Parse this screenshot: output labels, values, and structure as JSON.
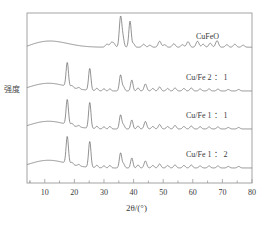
{
  "chart_data": {
    "type": "line",
    "title": "",
    "xlabel": "2θ/(°)",
    "ylabel": "强度",
    "xlim": [
      4,
      80
    ],
    "ylim": [
      0,
      1
    ],
    "grid": false,
    "legend_position": "inline-right",
    "xticks": [
      10,
      20,
      30,
      40,
      50,
      60,
      70,
      80
    ],
    "xtick_labels": [
      "10",
      "20",
      "30",
      "40",
      "50",
      "60",
      "70",
      "80"
    ],
    "yticks": [],
    "ytick_labels": [],
    "line_color": "#6e6e6e",
    "axis_color": "#9a9a9a",
    "series": [
      {
        "name": "CuFeO",
        "label": "CuFeO",
        "baseline": 50,
        "label_x": 196,
        "label_y": 32,
        "hump": {
          "center": 11,
          "width": 9,
          "height": 7
        },
        "slope": 8,
        "peaks": [
          {
            "two_theta": 31.0,
            "height": 3.0,
            "width": 0.5
          },
          {
            "two_theta": 32.5,
            "height": 4.5,
            "width": 0.5
          },
          {
            "two_theta": 33.4,
            "height": 3.2,
            "width": 0.45
          },
          {
            "two_theta": 35.6,
            "height": 30.0,
            "width": 0.42
          },
          {
            "two_theta": 36.4,
            "height": 9.0,
            "width": 0.4
          },
          {
            "two_theta": 38.8,
            "height": 26.0,
            "width": 0.4
          },
          {
            "two_theta": 40.0,
            "height": 3.5,
            "width": 0.4
          },
          {
            "two_theta": 43.4,
            "height": 3.0,
            "width": 0.5
          },
          {
            "two_theta": 45.5,
            "height": 2.0,
            "width": 0.5
          },
          {
            "two_theta": 48.8,
            "height": 6.0,
            "width": 0.5
          },
          {
            "two_theta": 50.5,
            "height": 2.5,
            "width": 0.5
          },
          {
            "two_theta": 53.6,
            "height": 3.5,
            "width": 0.5
          },
          {
            "two_theta": 56.5,
            "height": 2.5,
            "width": 0.5
          },
          {
            "two_theta": 58.4,
            "height": 5.5,
            "width": 0.5
          },
          {
            "two_theta": 61.6,
            "height": 6.0,
            "width": 0.5
          },
          {
            "two_theta": 63.5,
            "height": 3.0,
            "width": 0.5
          },
          {
            "two_theta": 65.9,
            "height": 4.0,
            "width": 0.5
          },
          {
            "two_theta": 68.2,
            "height": 6.5,
            "width": 0.5
          },
          {
            "two_theta": 71.5,
            "height": 2.5,
            "width": 0.5
          },
          {
            "two_theta": 74.2,
            "height": 3.0,
            "width": 0.5
          },
          {
            "two_theta": 77.0,
            "height": 2.0,
            "width": 0.5
          }
        ]
      },
      {
        "name": "Cu/Fe 2:1",
        "label": "Cu/Fe 2 ： 1",
        "baseline": 92,
        "label_x": 186,
        "label_y": 71,
        "hump": {
          "center": 11,
          "width": 9,
          "height": 8
        },
        "slope": 3,
        "peaks": [
          {
            "two_theta": 17.6,
            "height": 24.0,
            "width": 0.4
          },
          {
            "two_theta": 19.2,
            "height": 2.0,
            "width": 0.4
          },
          {
            "two_theta": 21.5,
            "height": 1.5,
            "width": 0.4
          },
          {
            "two_theta": 25.2,
            "height": 22.0,
            "width": 0.4
          },
          {
            "two_theta": 27.6,
            "height": 2.5,
            "width": 0.4
          },
          {
            "two_theta": 30.0,
            "height": 2.0,
            "width": 0.4
          },
          {
            "two_theta": 32.0,
            "height": 2.0,
            "width": 0.4
          },
          {
            "two_theta": 35.6,
            "height": 16.0,
            "width": 0.4
          },
          {
            "two_theta": 36.6,
            "height": 4.0,
            "width": 0.4
          },
          {
            "two_theta": 39.4,
            "height": 11.0,
            "width": 0.4
          },
          {
            "two_theta": 41.5,
            "height": 3.0,
            "width": 0.4
          },
          {
            "two_theta": 44.0,
            "height": 7.0,
            "width": 0.45
          },
          {
            "two_theta": 46.5,
            "height": 2.5,
            "width": 0.45
          },
          {
            "two_theta": 48.8,
            "height": 4.0,
            "width": 0.45
          },
          {
            "two_theta": 51.5,
            "height": 2.5,
            "width": 0.45
          },
          {
            "two_theta": 54.0,
            "height": 3.0,
            "width": 0.45
          },
          {
            "two_theta": 57.0,
            "height": 2.5,
            "width": 0.45
          },
          {
            "two_theta": 59.5,
            "height": 3.0,
            "width": 0.45
          },
          {
            "two_theta": 62.5,
            "height": 2.0,
            "width": 0.45
          },
          {
            "two_theta": 65.5,
            "height": 2.0,
            "width": 0.45
          },
          {
            "two_theta": 68.5,
            "height": 1.8,
            "width": 0.45
          },
          {
            "two_theta": 72.0,
            "height": 1.5,
            "width": 0.45
          },
          {
            "two_theta": 75.5,
            "height": 1.5,
            "width": 0.45
          }
        ]
      },
      {
        "name": "Cu/Fe 1:1",
        "label": "Cu/Fe 1 ： 1",
        "baseline": 130,
        "label_x": 186,
        "label_y": 109,
        "hump": {
          "center": 11,
          "width": 9,
          "height": 8
        },
        "slope": 3,
        "peaks": [
          {
            "two_theta": 17.6,
            "height": 25.0,
            "width": 0.4
          },
          {
            "two_theta": 19.2,
            "height": 2.2,
            "width": 0.4
          },
          {
            "two_theta": 21.5,
            "height": 1.5,
            "width": 0.4
          },
          {
            "two_theta": 25.2,
            "height": 26.0,
            "width": 0.4
          },
          {
            "two_theta": 27.6,
            "height": 2.5,
            "width": 0.4
          },
          {
            "two_theta": 30.0,
            "height": 2.0,
            "width": 0.4
          },
          {
            "two_theta": 32.0,
            "height": 2.5,
            "width": 0.4
          },
          {
            "two_theta": 35.6,
            "height": 14.0,
            "width": 0.4
          },
          {
            "two_theta": 36.6,
            "height": 4.0,
            "width": 0.4
          },
          {
            "two_theta": 39.4,
            "height": 9.0,
            "width": 0.4
          },
          {
            "two_theta": 41.5,
            "height": 3.0,
            "width": 0.4
          },
          {
            "two_theta": 44.0,
            "height": 7.5,
            "width": 0.45
          },
          {
            "two_theta": 46.5,
            "height": 2.5,
            "width": 0.45
          },
          {
            "two_theta": 48.8,
            "height": 4.5,
            "width": 0.45
          },
          {
            "two_theta": 51.5,
            "height": 2.5,
            "width": 0.45
          },
          {
            "two_theta": 54.0,
            "height": 3.5,
            "width": 0.45
          },
          {
            "two_theta": 57.0,
            "height": 2.5,
            "width": 0.45
          },
          {
            "two_theta": 59.5,
            "height": 3.0,
            "width": 0.45
          },
          {
            "two_theta": 62.5,
            "height": 2.2,
            "width": 0.45
          },
          {
            "two_theta": 65.5,
            "height": 2.0,
            "width": 0.45
          },
          {
            "two_theta": 68.5,
            "height": 2.0,
            "width": 0.45
          },
          {
            "two_theta": 72.0,
            "height": 1.5,
            "width": 0.45
          },
          {
            "two_theta": 75.5,
            "height": 1.5,
            "width": 0.45
          }
        ]
      },
      {
        "name": "Cu/Fe 1:2",
        "label": "Cu/Fe 1 ： 2",
        "baseline": 169,
        "label_x": 186,
        "label_y": 148,
        "hump": {
          "center": 11,
          "width": 9,
          "height": 8
        },
        "slope": 3,
        "peaks": [
          {
            "two_theta": 17.6,
            "height": 27.0,
            "width": 0.4
          },
          {
            "two_theta": 19.2,
            "height": 2.2,
            "width": 0.4
          },
          {
            "two_theta": 21.5,
            "height": 1.5,
            "width": 0.4
          },
          {
            "two_theta": 25.2,
            "height": 26.0,
            "width": 0.4
          },
          {
            "two_theta": 27.6,
            "height": 2.5,
            "width": 0.4
          },
          {
            "two_theta": 30.0,
            "height": 2.0,
            "width": 0.4
          },
          {
            "two_theta": 32.0,
            "height": 2.5,
            "width": 0.4
          },
          {
            "two_theta": 35.6,
            "height": 15.0,
            "width": 0.4
          },
          {
            "two_theta": 36.6,
            "height": 4.0,
            "width": 0.4
          },
          {
            "two_theta": 39.4,
            "height": 10.0,
            "width": 0.4
          },
          {
            "two_theta": 41.5,
            "height": 3.0,
            "width": 0.4
          },
          {
            "two_theta": 44.0,
            "height": 7.0,
            "width": 0.45
          },
          {
            "two_theta": 46.5,
            "height": 2.5,
            "width": 0.45
          },
          {
            "two_theta": 48.8,
            "height": 4.0,
            "width": 0.45
          },
          {
            "two_theta": 51.5,
            "height": 2.5,
            "width": 0.45
          },
          {
            "two_theta": 54.0,
            "height": 3.0,
            "width": 0.45
          },
          {
            "two_theta": 57.0,
            "height": 2.5,
            "width": 0.45
          },
          {
            "two_theta": 59.5,
            "height": 3.0,
            "width": 0.45
          },
          {
            "two_theta": 62.5,
            "height": 2.0,
            "width": 0.45
          },
          {
            "two_theta": 65.5,
            "height": 2.0,
            "width": 0.45
          },
          {
            "two_theta": 68.5,
            "height": 2.0,
            "width": 0.45
          },
          {
            "two_theta": 72.0,
            "height": 1.5,
            "width": 0.45
          },
          {
            "two_theta": 75.5,
            "height": 1.5,
            "width": 0.45
          }
        ]
      }
    ]
  },
  "axes": {
    "left": 27,
    "right": 252,
    "top": 13,
    "bottom": 183
  }
}
